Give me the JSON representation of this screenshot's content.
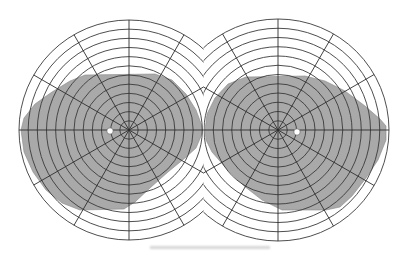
{
  "figure": {
    "background": "#ffffff",
    "field_fill": "#a9a9a9",
    "grid_color": "#3a3a3a",
    "midline_x": 203.5,
    "ring_count": 12,
    "ring_spacing_px": 9.1,
    "spoke_count": 12,
    "spoke_angle_step_deg": 30
  },
  "eyes": [
    {
      "name": "left-eye",
      "center": [
        129,
        130
      ],
      "outer_radius": 110,
      "blind_spot": [
        110,
        131
      ],
      "blind_spot_radius": 3.2,
      "field_polygon": [
        [
          21,
          130
        ],
        [
          24,
          118
        ],
        [
          35,
          104
        ],
        [
          52,
          92
        ],
        [
          70,
          81
        ],
        [
          85,
          75
        ],
        [
          155,
          74
        ],
        [
          172,
          80
        ],
        [
          186,
          94
        ],
        [
          196,
          110
        ],
        [
          202,
          126
        ],
        [
          202,
          134
        ],
        [
          196,
          148
        ],
        [
          185,
          158
        ],
        [
          168,
          172
        ],
        [
          150,
          188
        ],
        [
          135,
          202
        ],
        [
          124,
          209
        ],
        [
          80,
          210
        ],
        [
          62,
          203
        ],
        [
          46,
          190
        ],
        [
          33,
          172
        ],
        [
          24,
          152
        ]
      ]
    },
    {
      "name": "right-eye",
      "center": [
        278,
        130
      ],
      "outer_radius": 111,
      "blind_spot": [
        297,
        132
      ],
      "blind_spot_radius": 3.2,
      "field_polygon": [
        [
          205,
          130
        ],
        [
          207,
          114
        ],
        [
          215,
          98
        ],
        [
          228,
          84
        ],
        [
          246,
          77
        ],
        [
          305,
          76
        ],
        [
          325,
          81
        ],
        [
          345,
          91
        ],
        [
          365,
          106
        ],
        [
          380,
          119
        ],
        [
          386,
          126
        ],
        [
          386,
          140
        ],
        [
          378,
          160
        ],
        [
          366,
          178
        ],
        [
          352,
          196
        ],
        [
          340,
          207
        ],
        [
          326,
          210
        ],
        [
          282,
          210
        ],
        [
          262,
          200
        ],
        [
          244,
          186
        ],
        [
          226,
          168
        ],
        [
          212,
          152
        ],
        [
          206,
          140
        ]
      ]
    }
  ],
  "caption": {
    "text": ""
  }
}
